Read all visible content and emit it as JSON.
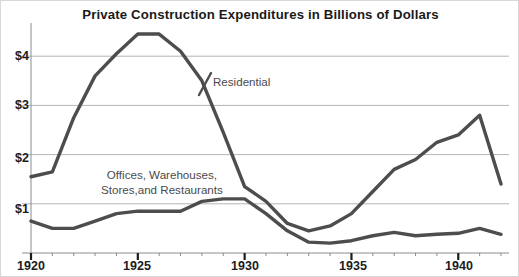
{
  "chart_data": {
    "type": "line",
    "title": "Private Construction Expenditures in Billions of Dollars",
    "xlabel": "",
    "ylabel": "",
    "xlim": [
      1920,
      1942
    ],
    "ylim": [
      0,
      4.6
    ],
    "grid": true,
    "legend_position": "inline-annotation",
    "y_ticks": [
      1,
      2,
      3,
      4
    ],
    "y_tick_labels": [
      "$1",
      "$2",
      "$3",
      "$4"
    ],
    "x_ticks": [
      1920,
      1925,
      1930,
      1935,
      1940
    ],
    "x_tick_labels": [
      "1920",
      "1925",
      "1930",
      "1935",
      "1940"
    ],
    "x_minor_tick_interval": 1,
    "line_color": "#4d4d4d",
    "grid_color": "#b4b4b4",
    "axis_color": "#8c8c8c",
    "x": [
      1920,
      1921,
      1922,
      1923,
      1924,
      1925,
      1926,
      1927,
      1928,
      1929,
      1930,
      1931,
      1932,
      1933,
      1934,
      1935,
      1936,
      1937,
      1938,
      1939,
      1940,
      1941,
      1942
    ],
    "series": [
      {
        "name": "Residential",
        "label": "Residential",
        "values": [
          1.55,
          1.65,
          2.75,
          3.6,
          4.05,
          4.45,
          4.45,
          4.1,
          3.5,
          2.45,
          1.35,
          1.05,
          0.6,
          0.45,
          0.55,
          0.8,
          1.25,
          1.7,
          1.9,
          2.25,
          2.4,
          2.8,
          1.4
        ]
      },
      {
        "name": "Offices, Warehouses, Stores, and Restaurants",
        "label_line1": "Offices, Warehouses,",
        "label_line2": "Stores,and Restaurants",
        "values": [
          0.65,
          0.5,
          0.5,
          0.65,
          0.8,
          0.85,
          0.85,
          0.85,
          1.05,
          1.1,
          1.1,
          0.8,
          0.45,
          0.22,
          0.2,
          0.25,
          0.35,
          0.42,
          0.35,
          0.38,
          0.4,
          0.5,
          0.38
        ]
      }
    ]
  },
  "annotations": {
    "residential": "Residential",
    "secondary_line1": "Offices, Warehouses,",
    "secondary_line2": "Stores,and Restaurants"
  },
  "axis": {
    "y_labels": [
      "$4",
      "$3",
      "$2",
      "$1"
    ],
    "x_labels": [
      "1920",
      "1925",
      "1930",
      "1935",
      "1940"
    ]
  }
}
